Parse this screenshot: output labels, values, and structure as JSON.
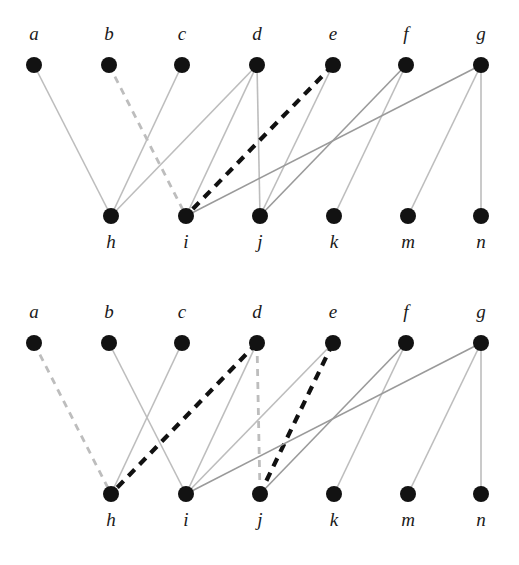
{
  "figure": {
    "width": 519,
    "height": 565,
    "background": "#ffffff"
  },
  "styles": {
    "node_color": "#121212",
    "node_radius": 8,
    "label_color": "#1a1a1a",
    "edge_light_gray": "#bdbdbd",
    "edge_mid_gray": "#9a9a9a",
    "edge_bold_black": "#111111",
    "edge_light_width": 1.6,
    "edge_mid_width": 1.6,
    "edge_bold_width": 4.2,
    "dash_gray": "7,6",
    "dash_bold": "9,7"
  },
  "graphs": [
    {
      "id": "graph-top",
      "name": "top-bipartite-graph",
      "top_nodes": [
        {
          "label": "a",
          "x": 34,
          "y": 65
        },
        {
          "label": "b",
          "x": 109,
          "y": 65
        },
        {
          "label": "c",
          "x": 182,
          "y": 65
        },
        {
          "label": "d",
          "x": 257,
          "y": 65
        },
        {
          "label": "e",
          "x": 333,
          "y": 65
        },
        {
          "label": "f",
          "x": 406,
          "y": 65
        },
        {
          "label": "g",
          "x": 481,
          "y": 65
        }
      ],
      "bottom_nodes": [
        {
          "label": "h",
          "x": 111,
          "y": 216
        },
        {
          "label": "i",
          "x": 186,
          "y": 216
        },
        {
          "label": "j",
          "x": 260,
          "y": 216
        },
        {
          "label": "k",
          "x": 334,
          "y": 216
        },
        {
          "label": "m",
          "x": 408,
          "y": 216
        },
        {
          "label": "n",
          "x": 481,
          "y": 216
        }
      ],
      "top_label_y": 40,
      "bottom_label_y": 248,
      "edges": [
        {
          "from": "a",
          "to": "h",
          "style": "light-solid"
        },
        {
          "from": "b",
          "to": "i",
          "style": "light-dashed"
        },
        {
          "from": "c",
          "to": "h",
          "style": "light-solid"
        },
        {
          "from": "d",
          "to": "h",
          "style": "light-solid"
        },
        {
          "from": "d",
          "to": "i",
          "style": "light-solid"
        },
        {
          "from": "d",
          "to": "j",
          "style": "light-solid"
        },
        {
          "from": "e",
          "to": "i",
          "style": "bold-dashed"
        },
        {
          "from": "e",
          "to": "j",
          "style": "light-solid"
        },
        {
          "from": "f",
          "to": "j",
          "style": "mid-solid"
        },
        {
          "from": "f",
          "to": "k",
          "style": "light-solid"
        },
        {
          "from": "g",
          "to": "i",
          "style": "mid-solid"
        },
        {
          "from": "g",
          "to": "m",
          "style": "light-solid"
        },
        {
          "from": "g",
          "to": "n",
          "style": "light-solid"
        }
      ]
    },
    {
      "id": "graph-bottom",
      "name": "bottom-bipartite-graph",
      "top_nodes": [
        {
          "label": "a",
          "x": 34,
          "y": 343
        },
        {
          "label": "b",
          "x": 109,
          "y": 343
        },
        {
          "label": "c",
          "x": 182,
          "y": 343
        },
        {
          "label": "d",
          "x": 257,
          "y": 343
        },
        {
          "label": "e",
          "x": 333,
          "y": 343
        },
        {
          "label": "f",
          "x": 406,
          "y": 343
        },
        {
          "label": "g",
          "x": 481,
          "y": 343
        }
      ],
      "bottom_nodes": [
        {
          "label": "h",
          "x": 111,
          "y": 494
        },
        {
          "label": "i",
          "x": 186,
          "y": 494
        },
        {
          "label": "j",
          "x": 260,
          "y": 494
        },
        {
          "label": "k",
          "x": 334,
          "y": 494
        },
        {
          "label": "m",
          "x": 408,
          "y": 494
        },
        {
          "label": "n",
          "x": 481,
          "y": 494
        }
      ],
      "top_label_y": 318,
      "bottom_label_y": 526,
      "edges": [
        {
          "from": "a",
          "to": "h",
          "style": "light-dashed"
        },
        {
          "from": "b",
          "to": "i",
          "style": "light-solid"
        },
        {
          "from": "c",
          "to": "h",
          "style": "light-solid"
        },
        {
          "from": "d",
          "to": "h",
          "style": "bold-dashed"
        },
        {
          "from": "d",
          "to": "i",
          "style": "light-solid"
        },
        {
          "from": "d",
          "to": "j",
          "style": "light-dashed"
        },
        {
          "from": "e",
          "to": "i",
          "style": "light-solid"
        },
        {
          "from": "e",
          "to": "j",
          "style": "bold-dashed"
        },
        {
          "from": "f",
          "to": "j",
          "style": "mid-solid"
        },
        {
          "from": "f",
          "to": "k",
          "style": "light-solid"
        },
        {
          "from": "g",
          "to": "i",
          "style": "mid-solid"
        },
        {
          "from": "g",
          "to": "m",
          "style": "light-solid"
        },
        {
          "from": "g",
          "to": "n",
          "style": "light-solid"
        }
      ]
    }
  ]
}
